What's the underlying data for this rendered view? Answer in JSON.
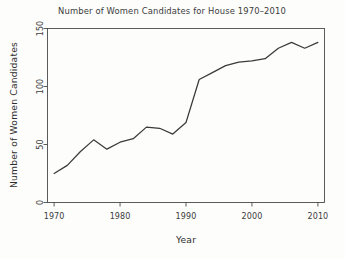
{
  "chart_data": {
    "type": "line",
    "title": "Number of Women Candidates for House 1970–2010",
    "xlabel": "Year",
    "ylabel": "Number of Women Candidates",
    "xlim": [
      1969,
      2011
    ],
    "ylim": [
      0,
      150
    ],
    "xticks": [
      1970,
      1980,
      1990,
      2000,
      2010
    ],
    "xtick_labels": [
      "1970",
      "1980",
      "1990",
      "2000",
      "2010"
    ],
    "yticks": [
      0,
      50,
      100,
      150
    ],
    "ytick_labels": [
      "0",
      "50",
      "100",
      "150"
    ],
    "grid": false,
    "legend": null,
    "line_color": "#3a3a3a",
    "x": [
      1970,
      1972,
      1974,
      1976,
      1978,
      1980,
      1982,
      1984,
      1986,
      1988,
      1990,
      1992,
      1994,
      1996,
      1998,
      2000,
      2002,
      2004,
      2006,
      2008,
      2010
    ],
    "values": [
      25,
      32,
      44,
      54,
      46,
      52,
      55,
      65,
      64,
      59,
      69,
      106,
      112,
      118,
      121,
      122,
      124,
      133,
      138,
      133,
      138
    ],
    "series": [
      {
        "name": "Women Candidates for House",
        "values": [
          25,
          32,
          44,
          54,
          46,
          52,
          55,
          65,
          64,
          59,
          69,
          106,
          112,
          118,
          121,
          122,
          124,
          133,
          138,
          133,
          138
        ]
      }
    ]
  },
  "figure": {
    "background_color": "#fdfdfc",
    "axis_color": "#4a4a4a",
    "text_color": "#3b3b3b"
  }
}
